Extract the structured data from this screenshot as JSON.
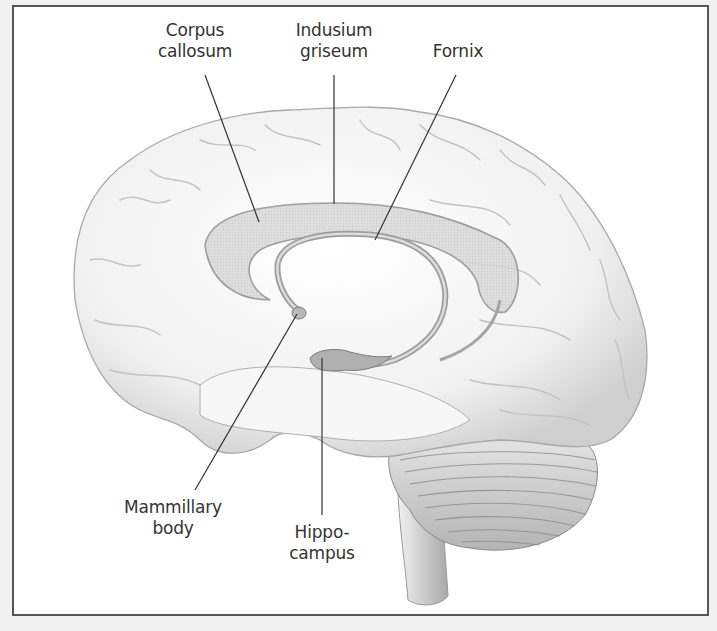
{
  "figure": {
    "type": "anatomical-illustration",
    "colors": {
      "frame": "#555555",
      "background": "#ffffff",
      "outer_background": "#f0f0f0",
      "label_text": "#333333",
      "leader_line": "#333333",
      "brain_fill": "#f4f4f4",
      "structure_fill": "#c8c8c8"
    }
  },
  "labels": {
    "corpus_callosum": {
      "line1": "Corpus",
      "line2": "callosum"
    },
    "indusium_griseum": {
      "line1": "Indusium",
      "line2": "griseum"
    },
    "fornix": {
      "line1": "Fornix"
    },
    "mammillary_body": {
      "line1": "Mammillary",
      "line2": "body"
    },
    "hippocampus": {
      "line1": "Hippo-",
      "line2": "campus"
    }
  }
}
